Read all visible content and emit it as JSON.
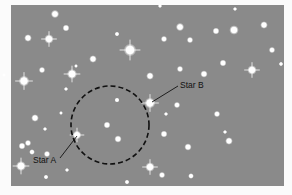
{
  "figure": {
    "background_color": "#8a8a8a",
    "star_color": "#ffffff",
    "circle": {
      "cx": 110,
      "cy": 125,
      "r": 39,
      "stroke": "#111111",
      "style": "dashed"
    },
    "labels": [
      {
        "id": "star-a",
        "text": "Star A",
        "x": 33,
        "y": 163,
        "line": [
          60,
          158,
          77,
          136
        ],
        "target": [
          77,
          135
        ]
      },
      {
        "id": "star-b",
        "text": "Star B",
        "x": 180,
        "y": 88,
        "line": [
          178,
          86,
          152,
          102
        ],
        "target": [
          150,
          103
        ]
      }
    ],
    "stars": [
      {
        "x": 55,
        "y": 14,
        "r": 2.6,
        "g": 0
      },
      {
        "x": 66,
        "y": 28,
        "r": 2.2,
        "g": 0
      },
      {
        "x": 28,
        "y": 38,
        "r": 2.4,
        "g": 0
      },
      {
        "x": 49,
        "y": 39,
        "r": 3,
        "g": 1
      },
      {
        "x": 117,
        "y": 34,
        "r": 1.5,
        "g": 0
      },
      {
        "x": 130,
        "y": 50,
        "r": 4,
        "g": 1
      },
      {
        "x": 93,
        "y": 59,
        "r": 2.4,
        "g": 0
      },
      {
        "x": 42,
        "y": 70,
        "r": 2,
        "g": 0
      },
      {
        "x": 72,
        "y": 74,
        "r": 3.2,
        "g": 1
      },
      {
        "x": 76,
        "y": 66,
        "r": 1.2,
        "g": 0
      },
      {
        "x": 24,
        "y": 81,
        "r": 3.4,
        "g": 1
      },
      {
        "x": 66,
        "y": 89,
        "r": 1.3,
        "g": 0
      },
      {
        "x": 160,
        "y": 6,
        "r": 1.3,
        "g": 0
      },
      {
        "x": 235,
        "y": 9,
        "r": 1.3,
        "g": 0
      },
      {
        "x": 180,
        "y": 27,
        "r": 2.6,
        "g": 0
      },
      {
        "x": 216,
        "y": 31,
        "r": 2.2,
        "g": 0
      },
      {
        "x": 234,
        "y": 30,
        "r": 3,
        "g": 0
      },
      {
        "x": 164,
        "y": 39,
        "r": 2,
        "g": 0
      },
      {
        "x": 190,
        "y": 40,
        "r": 2,
        "g": 0
      },
      {
        "x": 264,
        "y": 25,
        "r": 2.4,
        "g": 0
      },
      {
        "x": 272,
        "y": 50,
        "r": 2,
        "g": 0
      },
      {
        "x": 223,
        "y": 63,
        "r": 2.2,
        "g": 0
      },
      {
        "x": 252,
        "y": 70,
        "r": 3,
        "g": 1
      },
      {
        "x": 281,
        "y": 64,
        "r": 1.4,
        "g": 0
      },
      {
        "x": 180,
        "y": 69,
        "r": 2,
        "g": 0
      },
      {
        "x": 150,
        "y": 76,
        "r": 2.4,
        "g": 0
      },
      {
        "x": 204,
        "y": 74,
        "r": 2.3,
        "g": 0
      },
      {
        "x": 4,
        "y": 75,
        "r": 1.2,
        "g": 0
      },
      {
        "x": 150,
        "y": 103,
        "r": 3.4,
        "g": 1
      },
      {
        "x": 117,
        "y": 100,
        "r": 1.6,
        "g": 0
      },
      {
        "x": 107,
        "y": 125,
        "r": 2.2,
        "g": 0
      },
      {
        "x": 118,
        "y": 139,
        "r": 2.3,
        "g": 0
      },
      {
        "x": 77,
        "y": 135,
        "r": 2.8,
        "g": 1
      },
      {
        "x": 61,
        "y": 113,
        "r": 1.2,
        "g": 0
      },
      {
        "x": 35,
        "y": 118,
        "r": 2.4,
        "g": 0
      },
      {
        "x": 45,
        "y": 129,
        "r": 1.3,
        "g": 0
      },
      {
        "x": 22,
        "y": 146,
        "r": 2.2,
        "g": 0
      },
      {
        "x": 28,
        "y": 143,
        "r": 2,
        "g": 0
      },
      {
        "x": 32,
        "y": 152,
        "r": 1.8,
        "g": 0
      },
      {
        "x": 47,
        "y": 154,
        "r": 2,
        "g": 0
      },
      {
        "x": 21,
        "y": 166,
        "r": 3.2,
        "g": 1
      },
      {
        "x": 67,
        "y": 170,
        "r": 1.3,
        "g": 0
      },
      {
        "x": 46,
        "y": 177,
        "r": 1.5,
        "g": 0
      },
      {
        "x": 127,
        "y": 182,
        "r": 1.5,
        "g": 0
      },
      {
        "x": 177,
        "y": 105,
        "r": 2,
        "g": 0
      },
      {
        "x": 166,
        "y": 114,
        "r": 1.3,
        "g": 0
      },
      {
        "x": 217,
        "y": 114,
        "r": 2,
        "g": 0
      },
      {
        "x": 164,
        "y": 134,
        "r": 2.2,
        "g": 0
      },
      {
        "x": 225,
        "y": 132,
        "r": 1.3,
        "g": 0
      },
      {
        "x": 229,
        "y": 141,
        "r": 2.4,
        "g": 0
      },
      {
        "x": 188,
        "y": 147,
        "r": 2.3,
        "g": 0
      },
      {
        "x": 150,
        "y": 167,
        "r": 3,
        "g": 1
      },
      {
        "x": 162,
        "y": 175,
        "r": 2,
        "g": 0
      },
      {
        "x": 191,
        "y": 176,
        "r": 1.8,
        "g": 0
      }
    ]
  }
}
